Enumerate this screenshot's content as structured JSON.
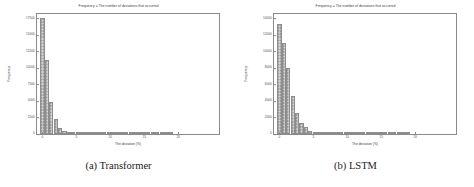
{
  "figure": {
    "subfigures": [
      {
        "caption": "(a) Transformer",
        "chart_data": {
          "type": "bar",
          "title": "Frequency = The number of deviations that occurred",
          "xlabel": "The deviation (%)",
          "ylabel": "Frequency",
          "grid": false,
          "legend": null,
          "xlim": [
            -0.8,
            26.0
          ],
          "ylim": [
            0,
            18200
          ],
          "xticks": [
            0,
            5,
            10,
            15,
            20
          ],
          "xtick_labels": [
            "0",
            "5",
            "10",
            "15",
            "20"
          ],
          "yticks": [
            0,
            2500,
            5000,
            7500,
            10000,
            12500,
            15000,
            17500
          ],
          "ytick_labels": [
            "0",
            "2500",
            "5000",
            "7500",
            "10000",
            "12500",
            "15000",
            "17500"
          ],
          "categories": [
            0,
            0.65,
            1.3,
            1.95,
            2.6,
            3.25,
            3.9,
            4.55,
            5.2,
            5.85,
            6.5,
            7.15,
            7.8,
            8.45,
            9.1,
            9.75,
            10.4,
            11.05,
            11.7,
            12.35,
            13.0,
            13.65,
            14.3,
            14.95,
            15.6,
            16.25,
            16.9,
            17.55,
            18.2,
            18.85
          ],
          "values": [
            17600,
            11200,
            4800,
            2300,
            880,
            420,
            330,
            300,
            270,
            250,
            230,
            200,
            120,
            90,
            70,
            55,
            45,
            35,
            30,
            25,
            20,
            18,
            15,
            12,
            10,
            9,
            8,
            7,
            6,
            5
          ]
        }
      },
      {
        "caption": "(b) LSTM",
        "chart_data": {
          "type": "bar",
          "title": "Frequency = The number of deviations that occurred",
          "xlabel": "The deviation (%)",
          "ylabel": "Frequency",
          "grid": false,
          "legend": null,
          "xlim": [
            -0.8,
            26.0
          ],
          "ylim": [
            0,
            14600
          ],
          "xticks": [
            0,
            5,
            10,
            15,
            20
          ],
          "xtick_labels": [
            "0",
            "5",
            "10",
            "15",
            "20"
          ],
          "yticks": [
            0,
            2000,
            4000,
            6000,
            8000,
            10000,
            12000,
            14000
          ],
          "ytick_labels": [
            "0",
            "2000",
            "4000",
            "6000",
            "8000",
            "10000",
            "12000",
            "14000"
          ],
          "categories": [
            0,
            0.65,
            1.3,
            1.95,
            2.6,
            3.25,
            3.9,
            4.55,
            5.2,
            5.85,
            6.5,
            7.15,
            7.8,
            8.45,
            9.1,
            9.75,
            10.4,
            11.05,
            11.7,
            12.35,
            13.0,
            13.65,
            14.3,
            14.95,
            15.6,
            16.25,
            16.9,
            17.55,
            18.2,
            18.85
          ],
          "values": [
            13400,
            11100,
            8000,
            4600,
            2500,
            1300,
            800,
            400,
            280,
            250,
            230,
            200,
            150,
            100,
            80,
            60,
            50,
            40,
            32,
            26,
            22,
            18,
            15,
            12,
            10,
            9,
            8,
            7,
            6,
            5
          ]
        }
      }
    ]
  }
}
